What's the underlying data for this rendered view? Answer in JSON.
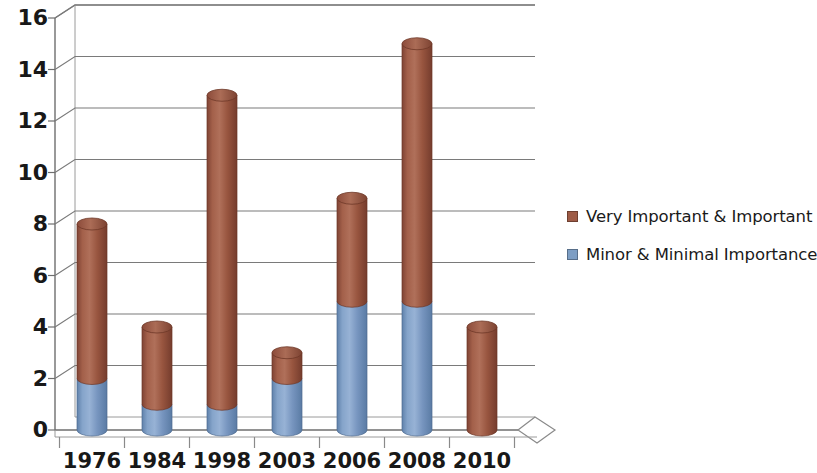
{
  "chart_data": {
    "type": "bar",
    "subtype": "stacked-3d-cylinder",
    "title": "",
    "subtitle": "",
    "xlabel": "",
    "ylabel": "",
    "categories": [
      "1976",
      "1984",
      "1998",
      "2003",
      "2006",
      "2008",
      "2010"
    ],
    "series": [
      {
        "name": "Minor & Minimal Importance",
        "color": "#7d9ec4",
        "values": [
          2,
          1,
          1,
          2,
          5,
          5,
          0
        ]
      },
      {
        "name": "Very Important & Important",
        "color": "#9e5b46",
        "values": [
          6,
          3,
          12,
          1,
          4,
          10,
          4
        ]
      }
    ],
    "totals": [
      8,
      4,
      13,
      3,
      9,
      15,
      4
    ],
    "ylim": [
      0,
      16
    ],
    "ytick_values": [
      0,
      2,
      4,
      6,
      8,
      10,
      12,
      14,
      16
    ],
    "ytick_labels": [
      "0",
      "2",
      "4",
      "6",
      "8",
      "10",
      "12",
      "14",
      "16"
    ],
    "ytick_step": 2,
    "grid": true,
    "grid_axis": "y",
    "legend_position": "right",
    "legend_entries": [
      {
        "label": "Very Important & Important",
        "color": "#9e5b46"
      },
      {
        "label": "Minor & Minimal Importance",
        "color": "#7d9ec4"
      }
    ],
    "stack_order": "minor-bottom-important-top"
  },
  "colors": {
    "important": "#9e5b46",
    "important_light": "#b5705a",
    "important_dark": "#7d4131",
    "minor": "#7d9ec4",
    "minor_light": "#9bb6d6",
    "minor_dark": "#5d7ea6",
    "axis": "#6e6e6e",
    "grid": "#7a7a7a",
    "text": "#181818",
    "background": "#ffffff"
  },
  "axes": {
    "y_labels": [
      "16",
      "14",
      "12",
      "10",
      "8",
      "6",
      "4",
      "2",
      "0"
    ],
    "x_labels": [
      "1976",
      "1984",
      "1998",
      "2003",
      "2006",
      "2008",
      "2010"
    ]
  },
  "legend": {
    "items": [
      {
        "label": "Very Important & Important",
        "swatch": "legend-swatch-important"
      },
      {
        "label": "Minor & Minimal Importance",
        "swatch": "legend-swatch-minor"
      }
    ]
  }
}
